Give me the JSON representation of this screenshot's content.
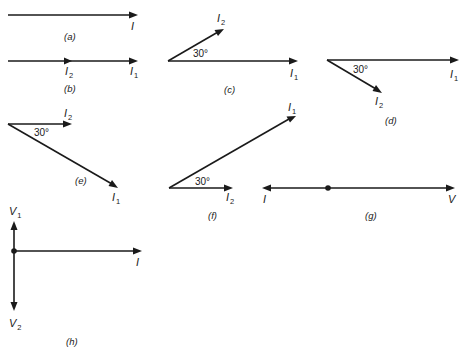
{
  "figure": {
    "stroke_color": "#1a1a1a",
    "background": "#ffffff"
  },
  "panels": {
    "a": {
      "caption": "(a)",
      "phasors": [
        {
          "name": "I",
          "sub": "",
          "angle_deg": 0
        }
      ]
    },
    "b": {
      "caption": "(b)",
      "phasors": [
        {
          "name": "I",
          "sub": "2",
          "angle_deg": 0
        },
        {
          "name": "I",
          "sub": "1",
          "angle_deg": 0
        }
      ]
    },
    "c": {
      "caption": "(c)",
      "angle_label": "30°",
      "phasors": [
        {
          "name": "I",
          "sub": "2",
          "angle_deg": 30
        },
        {
          "name": "I",
          "sub": "1",
          "angle_deg": 0
        }
      ]
    },
    "d": {
      "caption": "(d)",
      "angle_label": "30°",
      "phasors": [
        {
          "name": "I",
          "sub": "1",
          "angle_deg": 0
        },
        {
          "name": "I",
          "sub": "2",
          "angle_deg": -30
        }
      ]
    },
    "e": {
      "caption": "(e)",
      "angle_label": "30°",
      "phasors": [
        {
          "name": "I",
          "sub": "2",
          "angle_deg": 0
        },
        {
          "name": "I",
          "sub": "1",
          "angle_deg": -30
        }
      ]
    },
    "f": {
      "caption": "(f)",
      "angle_label": "30°",
      "phasors": [
        {
          "name": "I",
          "sub": "1",
          "angle_deg": 30
        },
        {
          "name": "I",
          "sub": "2",
          "angle_deg": 0
        }
      ]
    },
    "g": {
      "caption": "(g)",
      "phasors": [
        {
          "name": "I",
          "sub": "",
          "angle_deg": 180
        },
        {
          "name": "V",
          "sub": "",
          "angle_deg": 0
        }
      ]
    },
    "h": {
      "caption": "(h)",
      "phasors": [
        {
          "name": "V",
          "sub": "1",
          "angle_deg": 90
        },
        {
          "name": "V",
          "sub": "2",
          "angle_deg": -90
        },
        {
          "name": "I",
          "sub": "",
          "angle_deg": 0
        }
      ]
    }
  }
}
